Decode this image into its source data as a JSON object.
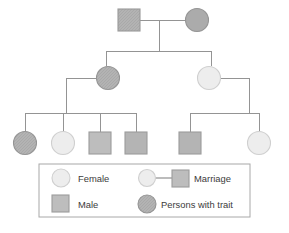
{
  "diagram": {
    "type": "pedigree-chart",
    "title": "",
    "background_color": "#ffffff",
    "line_color": "#8c8c8c",
    "colors": {
      "unaffected_fill": "#ececec",
      "unaffected_stroke": "#c9c9c9",
      "affected_fill": "#b3b3b3",
      "affected_stroke": "#9a9a9a",
      "male_fill": "#bdbdbd",
      "male_stroke": "#9c9c9c",
      "legend_border": "#aaaaaa",
      "text": "#3b3b3b"
    },
    "generations": [
      {
        "id": "generation-1",
        "label": "Generation I",
        "members": [
          {
            "id": "i-1",
            "sex": "male",
            "shape": "square",
            "affected": true,
            "label": ""
          },
          {
            "id": "i-2",
            "sex": "female",
            "shape": "circle",
            "affected": true,
            "label": ""
          }
        ]
      },
      {
        "id": "generation-2",
        "label": "Generation II",
        "members": [
          {
            "id": "ii-1",
            "sex": "female",
            "shape": "circle",
            "affected": true,
            "label": ""
          },
          {
            "id": "ii-2",
            "sex": "female",
            "shape": "circle",
            "affected": false,
            "label": ""
          }
        ]
      },
      {
        "id": "generation-3",
        "label": "Generation III",
        "members": [
          {
            "id": "iii-1",
            "sex": "female",
            "shape": "circle",
            "affected": true,
            "label": ""
          },
          {
            "id": "iii-2",
            "sex": "female",
            "shape": "circle",
            "affected": false,
            "label": ""
          },
          {
            "id": "iii-3",
            "sex": "male",
            "shape": "square",
            "affected": false,
            "label": ""
          },
          {
            "id": "iii-4",
            "sex": "male",
            "shape": "square",
            "affected": false,
            "label": ""
          },
          {
            "id": "iii-5",
            "sex": "male",
            "shape": "square",
            "affected": false,
            "label": ""
          },
          {
            "id": "iii-6",
            "sex": "female",
            "shape": "circle",
            "affected": false,
            "label": ""
          }
        ]
      }
    ],
    "legend": {
      "items": [
        {
          "id": "legend-female",
          "symbol": "circle-light",
          "label": "Female"
        },
        {
          "id": "legend-marriage",
          "symbol": "marriage-line",
          "label": "Marriage"
        },
        {
          "id": "legend-male",
          "symbol": "square-light",
          "label": "Male"
        },
        {
          "id": "legend-trait",
          "symbol": "circle-shaded",
          "label": "Persons with trait"
        }
      ]
    }
  }
}
